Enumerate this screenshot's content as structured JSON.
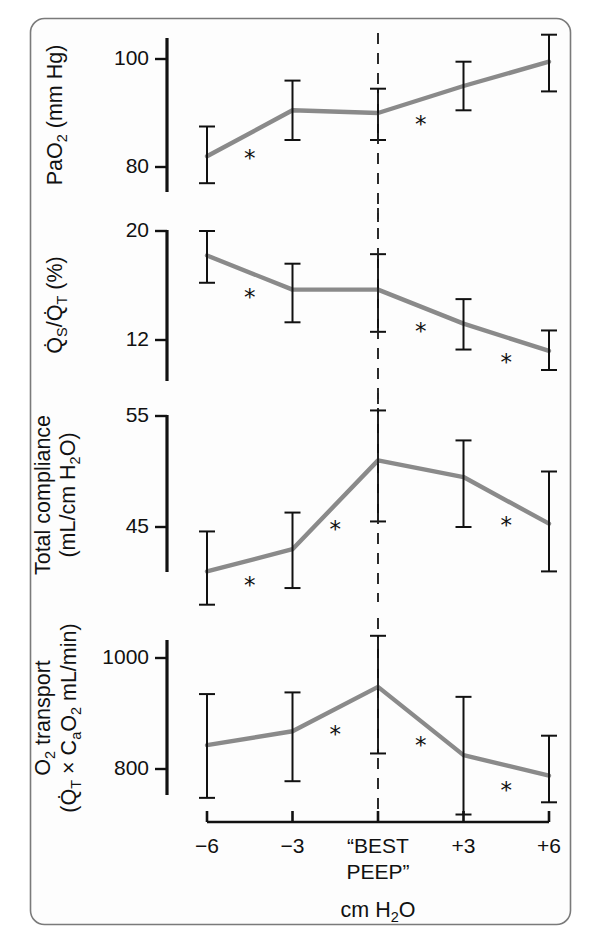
{
  "figure": {
    "title": "",
    "background": "#fdfdfd",
    "border_color": "#7a7a7a",
    "line_color": "#8a8a8a",
    "marker_color": "#111111"
  },
  "axis": {
    "x_title": "cm H₂O",
    "x_title_plain": "cm H2O",
    "categories": [
      "−6",
      "−3",
      "\"BEST PEEP\"",
      "+3",
      "+6"
    ],
    "category_labels": [
      {
        "line1": "−6",
        "line2": ""
      },
      {
        "line1": "−3",
        "line2": ""
      },
      {
        "line1": "“BEST",
        "line2": "PEEP”"
      },
      {
        "line1": "+3",
        "line2": ""
      },
      {
        "line1": "+6",
        "line2": ""
      }
    ],
    "reference_line_category": "\"BEST PEEP\"",
    "reference_line_style": "dashed"
  },
  "significance_marker": "*",
  "chart_data": [
    {
      "type": "line",
      "panel": 1,
      "title": "",
      "ylabel": "PaO₂ (mm Hg)",
      "ylabel_parts": {
        "pre": "PaO",
        "sub": "2",
        "post": " (mm Hg)"
      },
      "xlabel": "",
      "categories": [
        "−6",
        "−3",
        "\"BEST PEEP\"",
        "+3",
        "+6"
      ],
      "values": [
        82,
        90.5,
        90,
        95,
        99.5
      ],
      "err_low": [
        77,
        85,
        85,
        90.5,
        94
      ],
      "err_high": [
        87.5,
        96,
        94.5,
        99.5,
        104.5
      ],
      "yticks": [
        100,
        80
      ],
      "ylim": [
        74.5,
        105.5
      ],
      "grid": false,
      "legend": "none",
      "significance": [
        {
          "between": [
            "−6",
            "−3"
          ],
          "marker": "*"
        },
        {
          "between": [
            "\"BEST PEEP\"",
            "+3"
          ],
          "marker": "*"
        }
      ]
    },
    {
      "type": "line",
      "panel": 2,
      "title": "",
      "ylabel": "Q̇S/Q̇T (%)",
      "ylabel_parts": {
        "q1": "Q",
        "s1": "S",
        "slash": "/",
        "q2": "Q",
        "s2": "T",
        "post": " (%)"
      },
      "xlabel": "",
      "categories": [
        "−6",
        "−3",
        "\"BEST PEEP\"",
        "+3",
        "+6"
      ],
      "values": [
        18.2,
        15.7,
        15.7,
        13.2,
        11.2
      ],
      "err_low": [
        16.2,
        13.3,
        12.6,
        11.3,
        9.8
      ],
      "err_high": [
        20.0,
        17.6,
        18.3,
        15.0,
        12.7
      ],
      "yticks": [
        20,
        12
      ],
      "ylim": [
        8.6,
        20.6
      ],
      "grid": false,
      "legend": "none",
      "significance": [
        {
          "between": [
            "−6",
            "−3"
          ],
          "marker": "*"
        },
        {
          "between": [
            "\"BEST PEEP\"",
            "+3"
          ],
          "marker": "*"
        },
        {
          "between": [
            "+3",
            "+6"
          ],
          "marker": "*"
        }
      ]
    },
    {
      "type": "line",
      "panel": 3,
      "title": "",
      "ylabel": "Total compliance (mL/cm H₂O)",
      "ylabel_parts": {
        "line1": "Total compliance",
        "line2_pre": "(mL/cm H",
        "line2_sub": "2",
        "line2_post": "O)"
      },
      "xlabel": "",
      "categories": [
        "−6",
        "−3",
        "\"BEST PEEP\"",
        "+3",
        "+6"
      ],
      "values": [
        41.0,
        43.0,
        51.0,
        49.5,
        45.3
      ],
      "err_low": [
        38.0,
        39.5,
        45.5,
        45.0,
        41.0
      ],
      "err_high": [
        44.6,
        46.3,
        55.5,
        52.8,
        50.0
      ],
      "yticks": [
        55,
        45
      ],
      "ylim": [
        37.0,
        56.5
      ],
      "grid": false,
      "legend": "none",
      "significance": [
        {
          "between": [
            "−6",
            "−3"
          ],
          "marker": "*"
        },
        {
          "between": [
            "−3",
            "\"BEST PEEP\""
          ],
          "marker": "*"
        },
        {
          "between": [
            "+3",
            "+6"
          ],
          "marker": "*"
        }
      ]
    },
    {
      "type": "line",
      "panel": 4,
      "title": "",
      "ylabel": "O₂ transport (Q̇T × CaO₂ mL/min)",
      "ylabel_parts": {
        "line1_pre": "O",
        "line1_sub": "2",
        "line1_post": " transport",
        "line2_open": "(",
        "line2_q": "Q",
        "line2_qsub": "T",
        "line2_times": " × C",
        "line2_asub": "a",
        "line2_o": "O",
        "line2_osub": "2",
        "line2_post": " mL/min)"
      },
      "xlabel": "",
      "categories": [
        "−6",
        "−3",
        "\"BEST PEEP\"",
        "+3",
        "+6"
      ],
      "values": [
        843,
        868,
        948,
        825,
        788
      ],
      "err_low": [
        748,
        778,
        828,
        718,
        740
      ],
      "err_high": [
        935,
        938,
        1040,
        930,
        860
      ],
      "yticks": [
        1000,
        800
      ],
      "ylim": [
        700,
        1048
      ],
      "grid": false,
      "legend": "none",
      "significance": [
        {
          "between": [
            "−3",
            "\"BEST PEEP\""
          ],
          "marker": "*"
        },
        {
          "between": [
            "\"BEST PEEP\"",
            "+3"
          ],
          "marker": "*"
        },
        {
          "between": [
            "+3",
            "+6"
          ],
          "marker": "*"
        }
      ]
    }
  ]
}
